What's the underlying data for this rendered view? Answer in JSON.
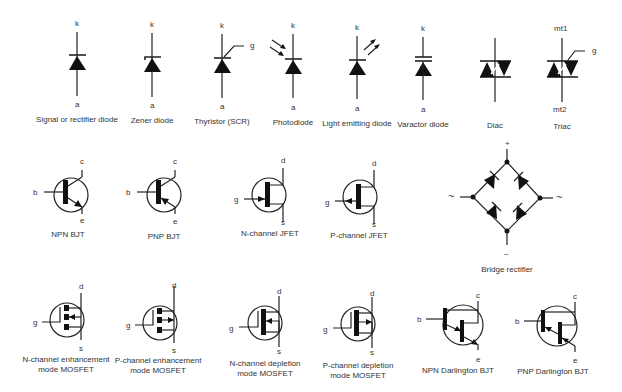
{
  "diagram": {
    "components": [
      {
        "id": "signal-diode",
        "caption": "Signal or rectifier diode",
        "pins": {
          "top": "k",
          "bottom": "a"
        }
      },
      {
        "id": "zener-diode",
        "caption": "Zener diode",
        "pins": {
          "top": "k",
          "bottom": "a"
        }
      },
      {
        "id": "thyristor",
        "caption": "Thyristor (SCR)",
        "pins": {
          "top": "k",
          "bottom": "a",
          "gate": "g"
        }
      },
      {
        "id": "photodiode",
        "caption": "Photodiode",
        "pins": {
          "top": "k",
          "bottom": "a"
        }
      },
      {
        "id": "led",
        "caption": "Light emitting diode",
        "pins": {
          "top": "k",
          "bottom": "a"
        }
      },
      {
        "id": "varactor",
        "caption": "Varactor diode",
        "pins": {
          "top": "k",
          "bottom": "a"
        }
      },
      {
        "id": "diac",
        "caption": "Diac",
        "pins": {}
      },
      {
        "id": "triac",
        "caption": "Triac",
        "pins": {
          "top": "mt1",
          "bottom": "mt2",
          "gate": "g"
        }
      },
      {
        "id": "npn-bjt",
        "caption": "NPN BJT",
        "pins": {
          "base": "b",
          "collector": "c",
          "emitter": "e"
        }
      },
      {
        "id": "pnp-bjt",
        "caption": "PNP BJT",
        "pins": {
          "base": "b",
          "collector": "c",
          "emitter": "e"
        }
      },
      {
        "id": "n-jfet",
        "caption": "N-channel JFET",
        "pins": {
          "gate": "g",
          "drain": "d",
          "source": "s"
        }
      },
      {
        "id": "p-jfet",
        "caption": "P-channel JFET",
        "pins": {
          "gate": "g",
          "drain": "d",
          "source": "s"
        }
      },
      {
        "id": "bridge",
        "caption": "Bridge rectifier",
        "pins": {
          "top": "+",
          "bottom": "–",
          "left": "~",
          "right": "~"
        }
      },
      {
        "id": "n-enh-mosfet",
        "caption_line1": "N-channel enhancement",
        "caption_line2": "mode MOSFET",
        "pins": {
          "gate": "g",
          "drain": "d",
          "source": "s"
        }
      },
      {
        "id": "p-enh-mosfet",
        "caption_line1": "P-channel enhancement",
        "caption_line2": "mode MOSFET",
        "pins": {
          "gate": "g",
          "drain": "d",
          "source": "s"
        }
      },
      {
        "id": "n-dep-mosfet",
        "caption_line1": "N-channel depletion",
        "caption_line2": "mode MOSFET",
        "pins": {
          "gate": "g",
          "drain": "d",
          "source": "s"
        }
      },
      {
        "id": "p-dep-mosfet",
        "caption_line1": "P-channel depletion",
        "caption_line2": "mode MOSFET",
        "pins": {
          "gate": "g",
          "drain": "d",
          "source": "s"
        }
      },
      {
        "id": "npn-darlington",
        "caption": "NPN Darlington BJT",
        "pins": {
          "base": "b",
          "collector": "c",
          "emitter": "e"
        }
      },
      {
        "id": "pnp-darlington",
        "caption": "PNP Darlington BJT",
        "pins": {
          "base": "b",
          "collector": "c",
          "emitter": "e"
        }
      }
    ]
  }
}
